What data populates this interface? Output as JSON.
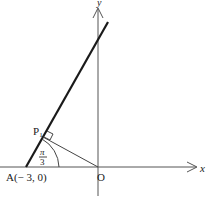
{
  "figure": {
    "axes": {
      "x_label": "x",
      "y_label": "y",
      "origin_label": "O"
    },
    "points": {
      "A": {
        "label": "A(− 3, 0)"
      },
      "P1": {
        "label": "P",
        "subscript": "1"
      }
    },
    "angle": {
      "numerator": "π",
      "denominator": "3"
    },
    "colors": {
      "ink": "#1a1a1a",
      "axis": "#555555",
      "background": "#ffffff"
    }
  }
}
